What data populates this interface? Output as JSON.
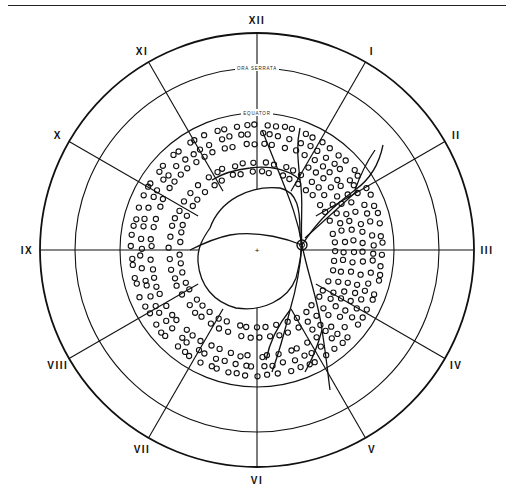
{
  "figure": {
    "type": "retinal fundus chart",
    "center": [
      257,
      250
    ],
    "circles": {
      "outer_radius": 217,
      "ora_serrata_radius": 182,
      "equator_radius": 137,
      "posterior_pole_radius": 68
    },
    "labels": {
      "ora_serrata": "ORA SERRATA",
      "equator": "EQUATOR"
    },
    "clock_hours": [
      {
        "label": "XII",
        "angle": 0
      },
      {
        "label": "I",
        "angle": 30
      },
      {
        "label": "II",
        "angle": 60
      },
      {
        "label": "III",
        "angle": 90
      },
      {
        "label": "IV",
        "angle": 120
      },
      {
        "label": "V",
        "angle": 150
      },
      {
        "label": "VI",
        "angle": 180
      },
      {
        "label": "VII",
        "angle": 210
      },
      {
        "label": "VIII",
        "angle": 240
      },
      {
        "label": "IX",
        "angle": 270
      },
      {
        "label": "X",
        "angle": 300
      },
      {
        "label": "XI",
        "angle": 330
      }
    ],
    "center_mark": "+",
    "optic_disc": {
      "x": 302,
      "y": 245,
      "r": 5
    },
    "colors": {
      "ink": "#111111",
      "background": "#ffffff"
    }
  }
}
